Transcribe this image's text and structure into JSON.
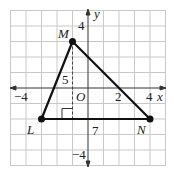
{
  "diagram": {
    "grid": {
      "xmin": -5,
      "xmax": 5,
      "ymin": -5,
      "ymax": 5,
      "color": "#c8c8c8"
    },
    "axes": {
      "x_label": "x",
      "y_label": "y",
      "origin_label": "O"
    },
    "tick_labels": {
      "x_neg": "−4",
      "x_2": "2",
      "x_4": "4",
      "y_pos": "4",
      "y_neg": "−4"
    },
    "points": [
      {
        "name": "M",
        "x": -1,
        "y": 3
      },
      {
        "name": "L",
        "x": -3,
        "y": -2
      },
      {
        "name": "N",
        "x": 4,
        "y": -2
      }
    ],
    "measure_labels": {
      "height": "5",
      "base": "7"
    }
  }
}
